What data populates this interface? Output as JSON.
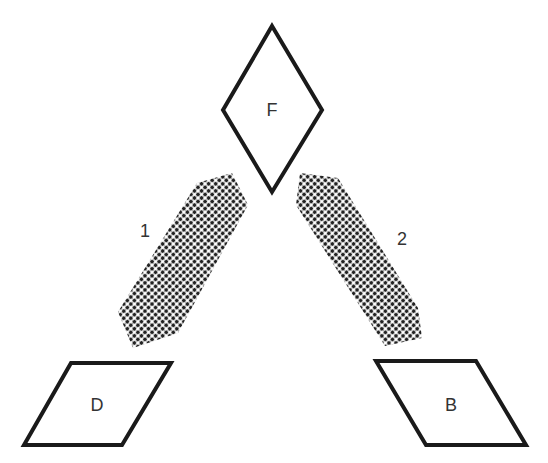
{
  "diagram": {
    "stroke_color": "#1a1a1a",
    "fill_pattern_color": "#222222",
    "nodes": [
      {
        "id": "F",
        "label": "F",
        "shape": "diamond"
      },
      {
        "id": "D",
        "label": "D",
        "shape": "parallelogram"
      },
      {
        "id": "B",
        "label": "B",
        "shape": "parallelogram"
      }
    ],
    "connectors": [
      {
        "id": "1",
        "label": "1",
        "from": "F",
        "to": "D",
        "style": "dotted-band"
      },
      {
        "id": "2",
        "label": "2",
        "from": "F",
        "to": "B",
        "style": "dotted-band"
      }
    ]
  }
}
